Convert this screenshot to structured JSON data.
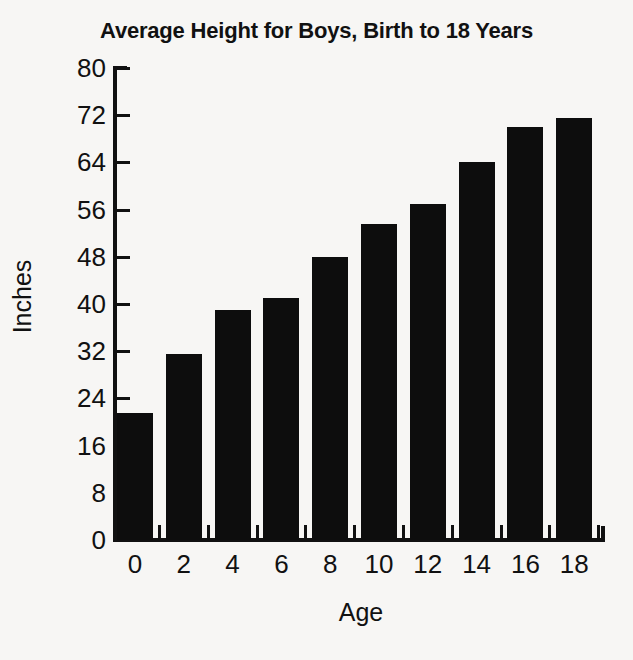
{
  "chart_data": {
    "type": "bar",
    "title": "Average Height for Boys, Birth to 18 Years",
    "xlabel": "Age",
    "ylabel": "Inches",
    "categories": [
      "0",
      "2",
      "4",
      "6",
      "8",
      "10",
      "12",
      "14",
      "16",
      "18"
    ],
    "values": [
      21.5,
      31.5,
      39,
      41,
      48,
      53.5,
      57,
      64,
      70,
      71.5
    ],
    "x": [
      0,
      2,
      4,
      6,
      8,
      10,
      12,
      14,
      16,
      18
    ],
    "xlim": [
      -1,
      19
    ],
    "ylim": [
      0,
      80
    ],
    "ytick_labels": [
      "0",
      "8",
      "16",
      "24",
      "32",
      "40",
      "48",
      "56",
      "64",
      "72",
      "80"
    ],
    "yticks": [
      0,
      8,
      16,
      24,
      32,
      40,
      48,
      56,
      64,
      72,
      80
    ],
    "xtick_labels": [
      "0",
      "2",
      "4",
      "6",
      "8",
      "10",
      "12",
      "14",
      "16",
      "18"
    ],
    "grid": false,
    "legend": false,
    "bar_color": "#0d0d0d",
    "background_color": "#f7f6f4",
    "axis_color": "#111111"
  }
}
